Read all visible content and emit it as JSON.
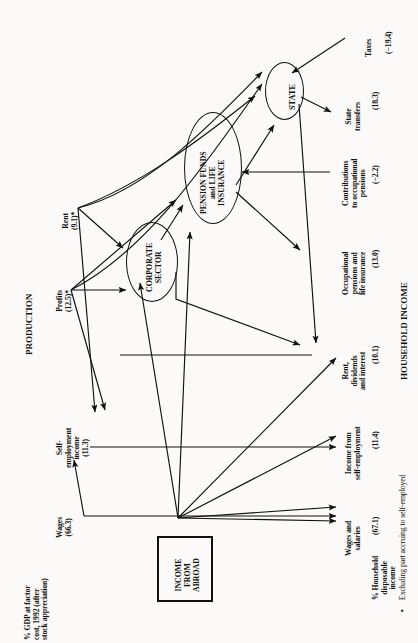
{
  "figure": {
    "type": "flow-diagram",
    "orientation": "rotated-90-ccw",
    "section_left": "PRODUCTION",
    "section_right": "HOUSEHOLD INCOME",
    "footnote_marker": "•",
    "footnote": "Excluding part accruing to self-employed"
  },
  "production": {
    "axis_caption": "% GDP at factor cost, 1992 (after stock appreciation)",
    "items": [
      {
        "label": "Wages",
        "value": "(66.3)"
      },
      {
        "label": "Self-\nemployment\nincome",
        "line1": "Self-",
        "line2": "employment",
        "line3": "income",
        "value": "(11.3)"
      },
      {
        "label": "Profits",
        "value": "(12.5)*"
      },
      {
        "label": "Rent",
        "value": "(9.1)*"
      }
    ]
  },
  "nodes": {
    "corporate_sector": {
      "line1": "CORPORATE",
      "line2": "SECTOR"
    },
    "pension_funds": {
      "line1": "PENSION FUNDS",
      "line2": "and LIFE",
      "line3": "INSURANCE"
    },
    "state": {
      "line1": "STATE"
    },
    "income_from_abroad": {
      "line1": "INCOME",
      "line2": "FROM",
      "line3": "ABROAD"
    }
  },
  "household": {
    "axis_caption": "% Household disposable income",
    "caption_lines": [
      "% Household",
      "disposable",
      "income"
    ],
    "items": [
      {
        "line1": "Wages and",
        "line2": "salaries",
        "value": "(67.1)"
      },
      {
        "line1": "Income from",
        "line2": "self-employment",
        "value": "(11.4)"
      },
      {
        "line1": "Rent,",
        "line2": "dividends",
        "line3": "and interest",
        "value": "(10.1)"
      },
      {
        "line1": "Occupational",
        "line2": "pensions and",
        "line3": "life insurance",
        "value": "(13.0)"
      },
      {
        "line1": "Contributions",
        "line2": "to occupational",
        "line3": "pensions",
        "value": "(−2.2)"
      },
      {
        "line1": "State",
        "line2": "transfers",
        "value": "(18.3)"
      },
      {
        "line1": "Taxes",
        "value": "(−19.4)"
      }
    ]
  },
  "colors": {
    "ink": "#111111",
    "paper": "#fbfaf8"
  }
}
